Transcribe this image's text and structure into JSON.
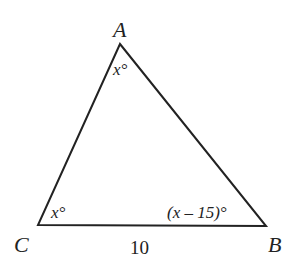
{
  "diagram": {
    "type": "triangle",
    "vertices": [
      {
        "name": "A",
        "x": 120,
        "y": 44
      },
      {
        "name": "B",
        "x": 266,
        "y": 226
      },
      {
        "name": "C",
        "x": 38,
        "y": 225
      }
    ],
    "labels": {
      "vertex_a": "A",
      "vertex_b": "B",
      "vertex_c": "C",
      "angle_a": "x°",
      "angle_c": "x°",
      "angle_b": "(x – 15)°",
      "side_cb": "10"
    },
    "stroke_color": "#222222"
  }
}
